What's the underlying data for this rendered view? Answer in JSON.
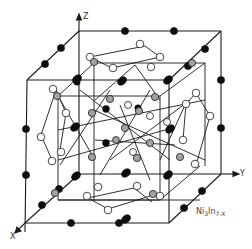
{
  "figure": {
    "formula_base_1": "Ni",
    "formula_sub_1": "3",
    "formula_base_2": "In",
    "formula_sub_2": "7-X",
    "axes": {
      "z": "Z",
      "y": "Y",
      "x": "X"
    }
  },
  "legend_atom_types": [
    "filled-black",
    "open-white",
    "hatched-gray"
  ],
  "colors": {
    "line": "#1a1a1a",
    "filled": "#0d0d0d",
    "open": "#ffffff",
    "hatched": "#a8a8a8"
  }
}
